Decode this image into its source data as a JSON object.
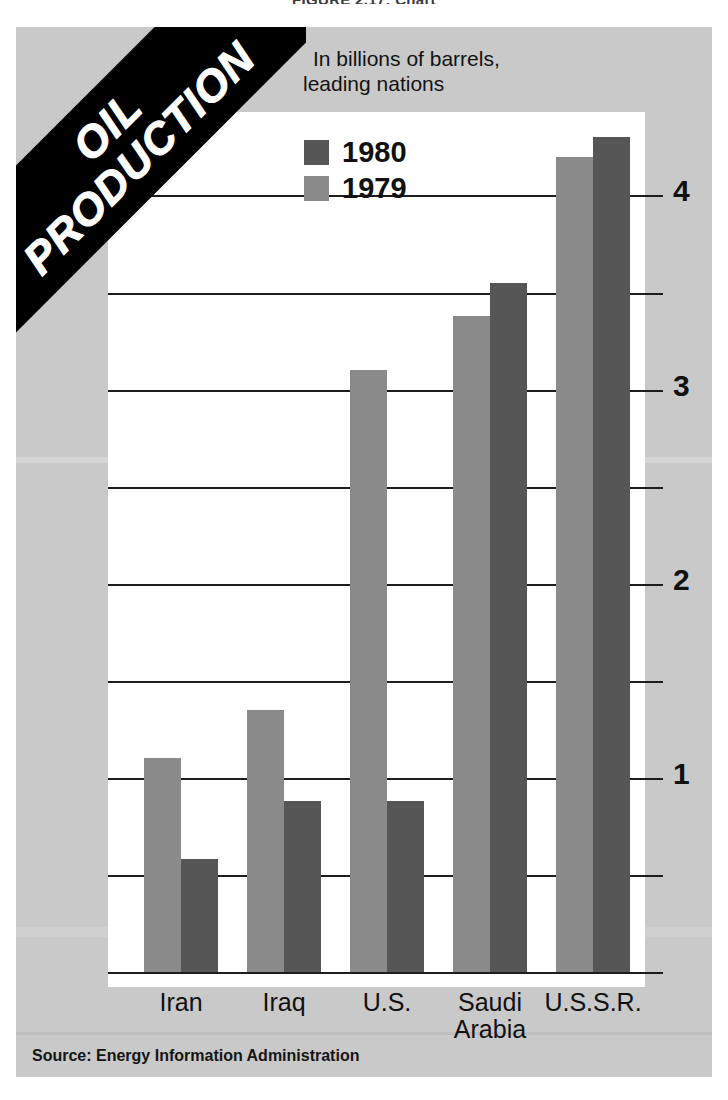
{
  "page_title": "FIGURE 2.17: Chart",
  "banner": {
    "line1": "OIL",
    "line2": "PRODUCTION",
    "text": "OIL\nPRODUCTION"
  },
  "subtitle": {
    "line1": "In billions of barrels,",
    "line2": "leading nations"
  },
  "source": "Source: Energy Information Administration",
  "legend": {
    "position": "top-center-left",
    "items": [
      {
        "label": "1980",
        "color": "#565656"
      },
      {
        "label": "1979",
        "color": "#8a8a8a"
      }
    ]
  },
  "axis": {
    "y_ticks": [
      "1",
      "2",
      "3",
      "4"
    ],
    "y_tick_values": [
      1,
      2,
      3,
      4
    ],
    "y_minor_values": [
      0.5,
      1.5,
      2.5,
      3.5
    ],
    "y_min": 0,
    "y_max": 4.43
  },
  "categories": [
    {
      "label": "Iran"
    },
    {
      "label": "Iraq"
    },
    {
      "label": "U.S."
    },
    {
      "label": "Saudi",
      "label2": "Arabia"
    },
    {
      "label": "U.S.S.R."
    }
  ],
  "chart_data": {
    "type": "bar",
    "title": "OIL PRODUCTION",
    "subtitle": "In billions of barrels, leading nations",
    "xlabel": "",
    "ylabel": "Billions of barrels",
    "ylim": [
      0,
      4.43
    ],
    "grid": true,
    "legend_position": "top-center",
    "source": "Source: Energy Information Administration",
    "categories": [
      "Iran",
      "Iraq",
      "U.S.",
      "Saudi Arabia",
      "U.S.S.R."
    ],
    "series": [
      {
        "name": "1980",
        "color": "#8a8a8a",
        "values": [
          1.1,
          1.35,
          3.1,
          3.38,
          4.2
        ]
      },
      {
        "name": "1979",
        "color": "#565656",
        "values": [
          0.58,
          0.88,
          0.88,
          3.55,
          4.3
        ]
      }
    ],
    "annotations": []
  }
}
